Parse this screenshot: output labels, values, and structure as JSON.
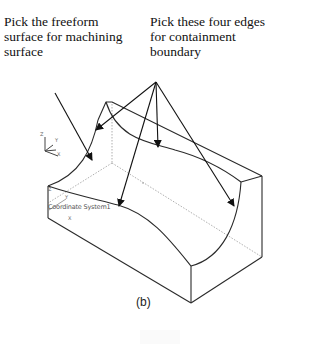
{
  "annotations": {
    "left_label": "Pick the freeform\nsurface for machining\nsurface",
    "right_label": "Pick these four edges\nfor containment\nboundary"
  },
  "model": {
    "coordinate_system_label": "Coordinate System1",
    "triad_axes": [
      "Z",
      "Y",
      "X"
    ],
    "corner_axes": [
      "Z",
      "Y",
      "X"
    ]
  },
  "caption": "(b)",
  "colors": {
    "line": "#2a2a2a",
    "hidden_line": "#9a9a9a",
    "arrow": "#111111",
    "background": "#ffffff"
  }
}
